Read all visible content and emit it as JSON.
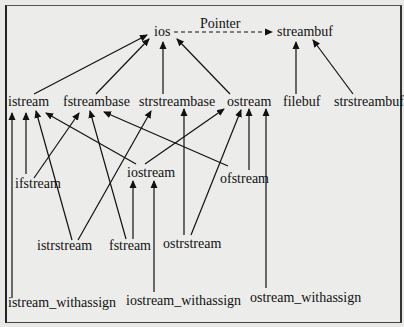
{
  "edge_label": "Pointer",
  "nodes": {
    "ios": "ios",
    "streambuf": "streambuf",
    "istream": "istream",
    "fstreambase": "fstreambase",
    "strstreambase": "strstreambase",
    "ostream": "ostream",
    "filebuf": "filebuf",
    "strstreambuf": "strstreambuf",
    "ifstream": "ifstream",
    "iostream": "iostream",
    "ofstream": "ofstream",
    "istrstream": "istrstream",
    "fstream": "fstream",
    "ostrstream": "ostrstream",
    "istream_withassign": "istream_withassign",
    "iostream_withassign": "iostream_withassign",
    "ostream_withassign": "ostream_withassign"
  },
  "edges": [
    {
      "from": "ios",
      "to": "streambuf",
      "style": "dashed",
      "label": "Pointer"
    },
    {
      "from": "istream",
      "to": "ios"
    },
    {
      "from": "fstreambase",
      "to": "ios"
    },
    {
      "from": "strstreambase",
      "to": "ios"
    },
    {
      "from": "ostream",
      "to": "ios"
    },
    {
      "from": "filebuf",
      "to": "streambuf"
    },
    {
      "from": "strstreambuf",
      "to": "streambuf"
    },
    {
      "from": "ifstream",
      "to": "istream"
    },
    {
      "from": "ifstream",
      "to": "fstreambase"
    },
    {
      "from": "iostream",
      "to": "istream"
    },
    {
      "from": "iostream",
      "to": "ostream"
    },
    {
      "from": "ofstream",
      "to": "ostream"
    },
    {
      "from": "ofstream",
      "to": "fstreambase"
    },
    {
      "from": "istrstream",
      "to": "istream"
    },
    {
      "from": "istrstream",
      "to": "strstreambase"
    },
    {
      "from": "fstream",
      "to": "fstreambase"
    },
    {
      "from": "fstream",
      "to": "iostream"
    },
    {
      "from": "ostrstream",
      "to": "strstreambase"
    },
    {
      "from": "ostrstream",
      "to": "ostream"
    },
    {
      "from": "istream_withassign",
      "to": "istream"
    },
    {
      "from": "iostream_withassign",
      "to": "iostream"
    },
    {
      "from": "ostream_withassign",
      "to": "ostream"
    }
  ]
}
